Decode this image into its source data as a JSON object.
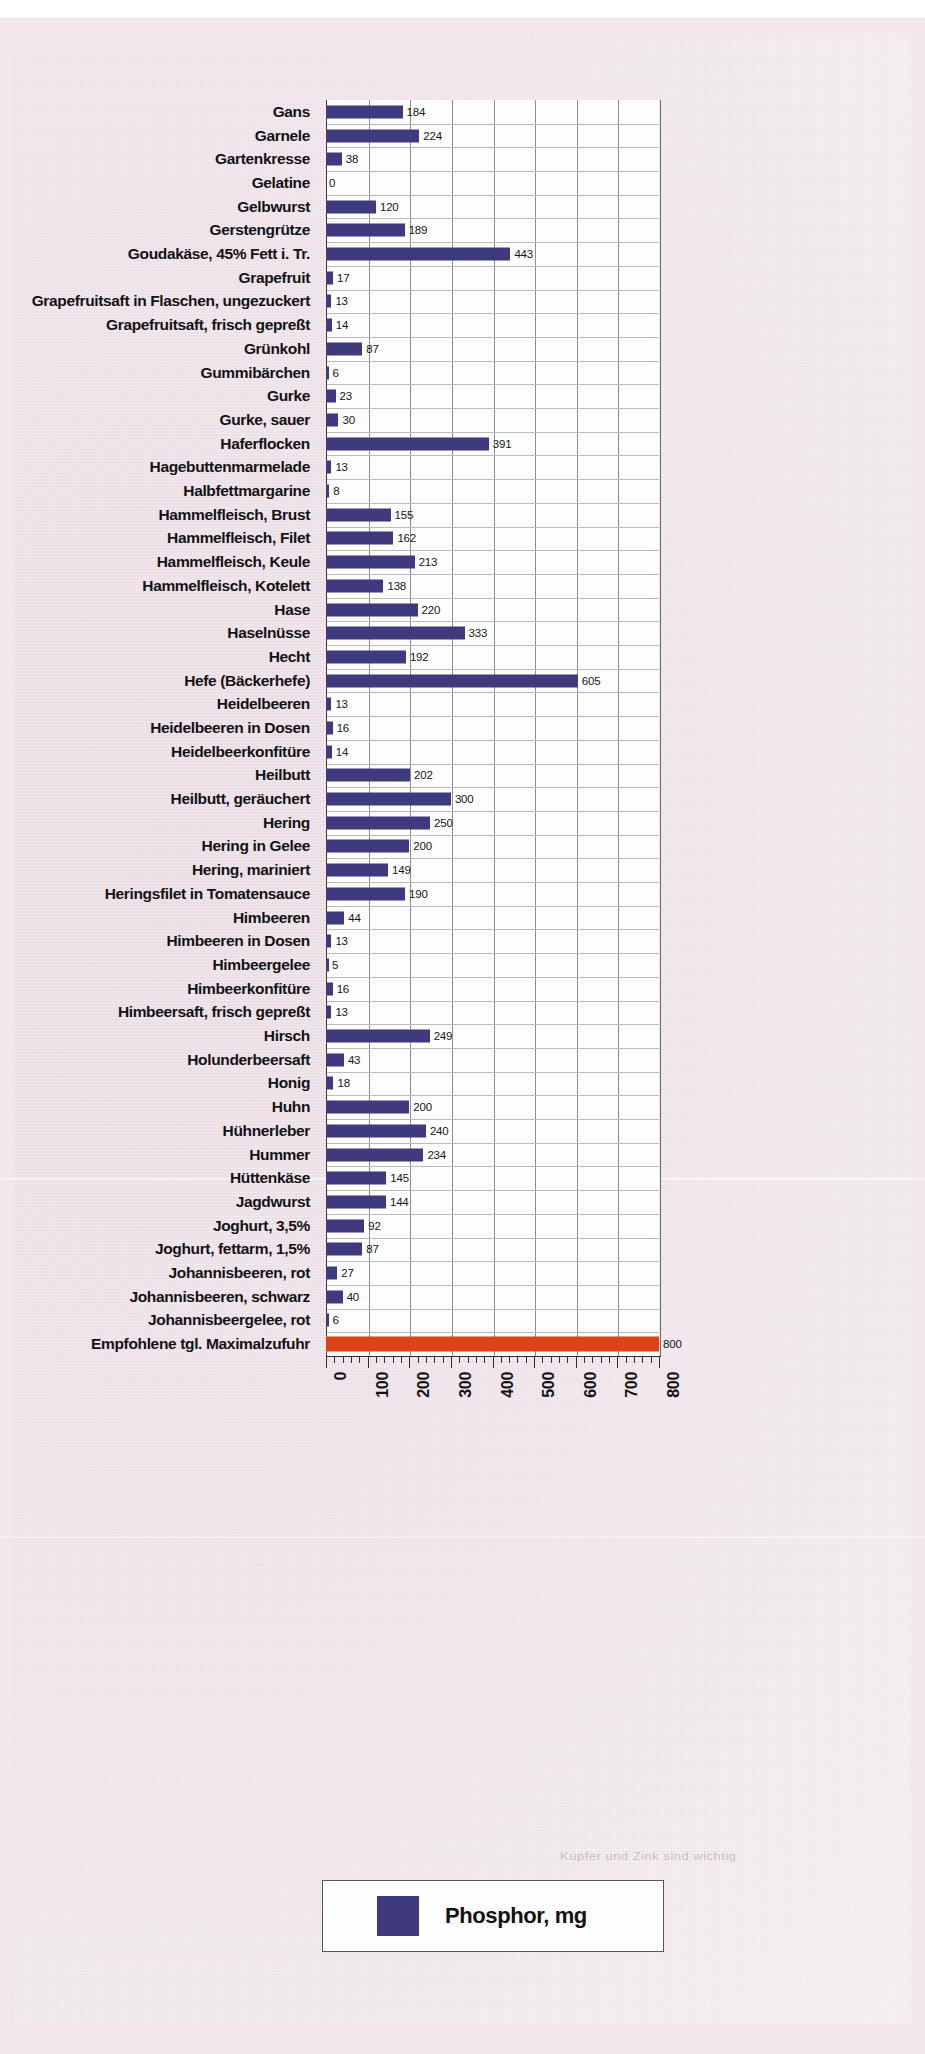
{
  "chart_data": {
    "type": "bar",
    "orientation": "horizontal",
    "title": "",
    "xlabel": "",
    "ylabel": "",
    "xlim": [
      0,
      800
    ],
    "xticks": [
      0,
      100,
      200,
      300,
      400,
      500,
      600,
      700,
      800
    ],
    "xticklabels": [
      "0",
      "100",
      "200",
      "300",
      "400",
      "500",
      "600",
      "700",
      "800"
    ],
    "grid": true,
    "minor_ticks_per_interval": 5,
    "unit": "mg",
    "series_name": "Phosphor, mg",
    "bar_color": "#3f3a7e",
    "reference_color": "#dd4316",
    "categories": [
      "Gans",
      "Garnele",
      "Gartenkresse",
      "Gelatine",
      "Gelbwurst",
      "Gerstengrütze",
      "Goudakäse, 45% Fett i. Tr.",
      "Grapefruit",
      "Grapefruitsaft in Flaschen, ungezuckert",
      "Grapefruitsaft, frisch gepreßt",
      "Grünkohl",
      "Gummibärchen",
      "Gurke",
      "Gurke, sauer",
      "Haferflocken",
      "Hagebuttenmarmelade",
      "Halbfettmargarine",
      "Hammelfleisch, Brust",
      "Hammelfleisch, Filet",
      "Hammelfleisch, Keule",
      "Hammelfleisch, Kotelett",
      "Hase",
      "Haselnüsse",
      "Hecht",
      "Hefe (Bäckerhefe)",
      "Heidelbeeren",
      "Heidelbeeren in Dosen",
      "Heidelbeerkonfitüre",
      "Heilbutt",
      "Heilbutt, geräuchert",
      "Hering",
      "Hering in Gelee",
      "Hering, mariniert",
      "Heringsfilet in Tomatensauce",
      "Himbeeren",
      "Himbeeren in Dosen",
      "Himbeergelee",
      "Himbeerkonfitüre",
      "Himbeersaft, frisch gepreßt",
      "Hirsch",
      "Holunderbeersaft",
      "Honig",
      "Huhn",
      "Hühnerleber",
      "Hummer",
      "Hüttenkäse",
      "Jagdwurst",
      "Joghurt, 3,5%",
      "Joghurt, fettarm, 1,5%",
      "Johannisbeeren, rot",
      "Johannisbeeren, schwarz",
      "Johannisbeergelee, rot",
      "Empfohlene tgl. Maximalzufuhr"
    ],
    "values": [
      184,
      224,
      38,
      0,
      120,
      189,
      443,
      17,
      13,
      14,
      87,
      6,
      23,
      30,
      391,
      13,
      8,
      155,
      162,
      213,
      138,
      220,
      333,
      192,
      605,
      13,
      16,
      14,
      202,
      300,
      250,
      200,
      149,
      190,
      44,
      13,
      5,
      16,
      13,
      249,
      43,
      18,
      200,
      240,
      234,
      145,
      144,
      92,
      87,
      27,
      40,
      6,
      800
    ],
    "reference_index": 52
  },
  "legend": {
    "label": "Phosphor, mg"
  },
  "ghost_text": "Kupfer und Zink sind wichtig"
}
